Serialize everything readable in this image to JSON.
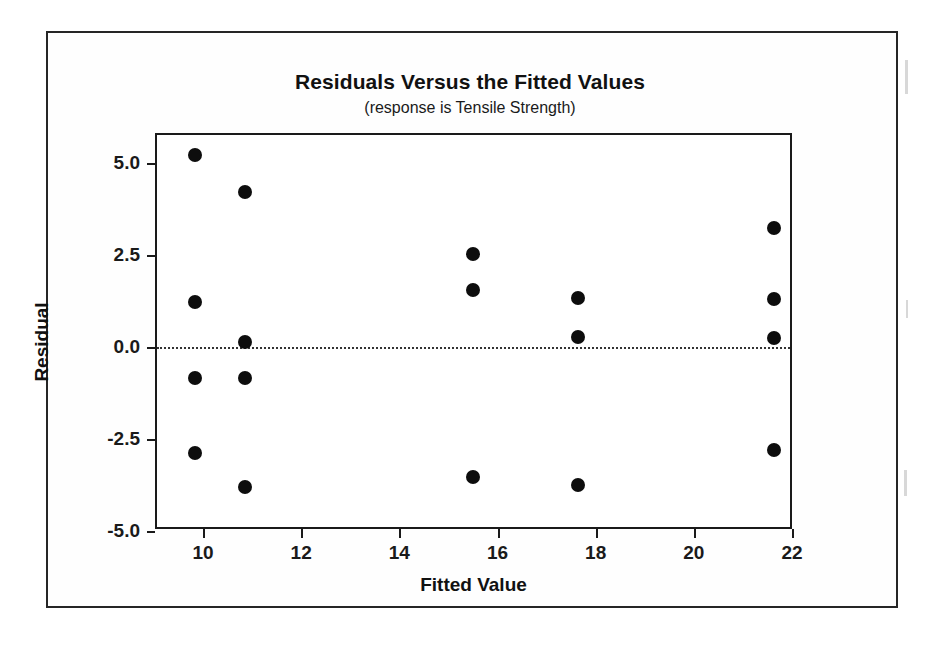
{
  "chart_data": {
    "type": "scatter",
    "title": "Residuals Versus the Fitted Values",
    "subtitle": "(response is Tensile Strength)",
    "xlabel": "Fitted Value",
    "ylabel": "Residual",
    "xlim": [
      9.0,
      22.4
    ],
    "ylim": [
      -5.6,
      5.9
    ],
    "xticks": [
      10,
      12,
      14,
      16,
      18,
      20,
      22
    ],
    "xtick_labels": [
      "10",
      "12",
      "14",
      "16",
      "18",
      "20",
      "22"
    ],
    "yticks": [
      5.0,
      2.5,
      0.0,
      -2.5,
      -5.0
    ],
    "ytick_labels": [
      "5.0",
      "2.5",
      "0.0",
      "-2.5",
      "-5.0"
    ],
    "grid": false,
    "legend": null,
    "reference_line": {
      "y": 0.0,
      "style": "dotted",
      "color": "#333333"
    },
    "marker": {
      "shape": "circle",
      "filled": true,
      "color": "#0d0d0d",
      "size": 14
    },
    "points": [
      {
        "x": 9.8,
        "y": 5.27
      },
      {
        "x": 9.8,
        "y": 1.29
      },
      {
        "x": 9.8,
        "y": -0.8
      },
      {
        "x": 9.8,
        "y": -2.83
      },
      {
        "x": 10.81,
        "y": 4.26
      },
      {
        "x": 10.81,
        "y": 0.19
      },
      {
        "x": 10.81,
        "y": -0.8
      },
      {
        "x": 10.81,
        "y": -3.74
      },
      {
        "x": 15.45,
        "y": 2.58
      },
      {
        "x": 15.45,
        "y": 1.59
      },
      {
        "x": 15.45,
        "y": -3.47
      },
      {
        "x": 17.6,
        "y": 1.38
      },
      {
        "x": 17.6,
        "y": 0.33
      },
      {
        "x": 17.6,
        "y": -3.7
      },
      {
        "x": 21.6,
        "y": 3.3
      },
      {
        "x": 21.6,
        "y": 1.35
      },
      {
        "x": 21.6,
        "y": 0.3
      },
      {
        "x": 21.6,
        "y": -2.75
      }
    ],
    "colors": {
      "marker": "#0d0d0d",
      "axis": "#1a1a1a",
      "text": "#111111",
      "background": "#ffffff",
      "frame": "#262626"
    }
  }
}
